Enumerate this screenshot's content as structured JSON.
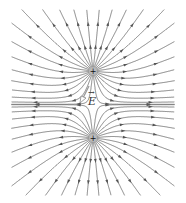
{
  "diagram": {
    "charges": [
      {
        "label": "+",
        "x": 93,
        "y": 71,
        "sign": "positive"
      },
      {
        "label": "+",
        "x": 93,
        "y": 138,
        "sign": "positive"
      }
    ],
    "field_vector": {
      "label": "E",
      "from": [
        89,
        86
      ],
      "to": [
        81,
        101
      ],
      "label_pos": [
        88,
        98
      ]
    },
    "line_color": "#666666",
    "lines_per_charge": 28,
    "bounds": {
      "left": 12,
      "right": 174,
      "top": 10,
      "bottom": 195
    }
  }
}
